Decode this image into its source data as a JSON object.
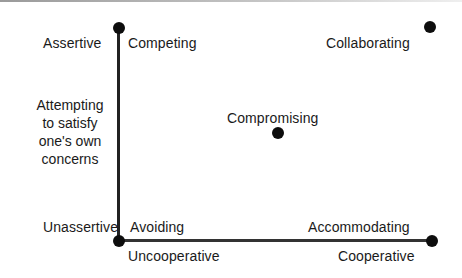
{
  "diagram": {
    "type": "two-dimensional conflict-handling modes grid",
    "axes": {
      "vertical": {
        "top_label": "Assertive",
        "bottom_label": "Unassertive",
        "description_lines": [
          "Attempting",
          "to satisfy",
          "one's own",
          "concerns"
        ]
      },
      "horizontal": {
        "left_label": "Uncooperative",
        "right_label": "Cooperative"
      }
    },
    "modes": [
      {
        "name": "Competing",
        "position": "top-left"
      },
      {
        "name": "Collaborating",
        "position": "top-right"
      },
      {
        "name": "Compromising",
        "position": "center"
      },
      {
        "name": "Avoiding",
        "position": "bottom-left"
      },
      {
        "name": "Accommodating",
        "position": "bottom-right"
      }
    ],
    "colors": {
      "ink": "#1a1a1a",
      "background": "#ffffff"
    }
  }
}
